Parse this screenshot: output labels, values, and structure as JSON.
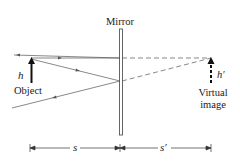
{
  "diagram": {
    "type": "plane-mirror-ray-diagram",
    "labels": {
      "mirror": "Mirror",
      "object_height": "h",
      "object": "Object",
      "image_height": "h′",
      "image_line1": "Virtual",
      "image_line2": "image",
      "object_distance": "s",
      "image_distance": "s′"
    },
    "colors": {
      "line": "#3a3a3a",
      "mirror": "#555555",
      "text": "#1a1a1a",
      "background": "#ffffff"
    }
  }
}
